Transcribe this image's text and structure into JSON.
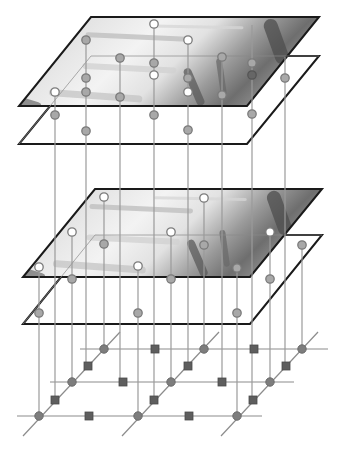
{
  "diagram": {
    "kind": "multi-layer 3D lattice with image planes",
    "colors": {
      "background": "#ffffff",
      "plane_border": "#1a1a1a",
      "vertical_line": "#9a9a9a",
      "grid_line": "#8c8c8c",
      "node_gray_fill": "#a8a8a8",
      "node_gray_stroke": "#7a7a7a",
      "node_white_fill": "#ffffff",
      "node_white_stroke": "#7a7a7a",
      "node_dark_fill": "#666666",
      "grid_circle_fill": "#7d7d7d",
      "grid_square_fill": "#5e5e5e"
    },
    "planes": [
      {
        "name": "top-image-plane",
        "image": true,
        "points": [
          [
            91,
            17
          ],
          [
            319,
            17
          ],
          [
            247,
            106
          ],
          [
            19,
            106
          ]
        ]
      },
      {
        "name": "top-blank-plane",
        "image": false,
        "points": [
          [
            91,
            56
          ],
          [
            319,
            56
          ],
          [
            247,
            144
          ],
          [
            19,
            144
          ]
        ]
      },
      {
        "name": "lower-image-plane",
        "image": true,
        "points": [
          [
            95,
            189
          ],
          [
            322,
            189
          ],
          [
            250,
            277
          ],
          [
            23,
            277
          ]
        ]
      },
      {
        "name": "lower-blank-plane",
        "image": false,
        "points": [
          [
            95,
            235
          ],
          [
            322,
            235
          ],
          [
            250,
            324
          ],
          [
            23,
            324
          ]
        ]
      }
    ],
    "verticals": [
      {
        "x": 55,
        "y1": 92,
        "y2": 400
      },
      {
        "x": 86,
        "y1": 40,
        "y2": 366
      },
      {
        "x": 120,
        "y1": 58,
        "y2": 382
      },
      {
        "x": 154,
        "y1": 24,
        "y2": 400
      },
      {
        "x": 188,
        "y1": 40,
        "y2": 366
      },
      {
        "x": 222,
        "y1": 57,
        "y2": 382
      },
      {
        "x": 252,
        "y1": 25,
        "y2": 400
      },
      {
        "x": 285,
        "y1": 57,
        "y2": 366
      },
      {
        "x": 39,
        "y1": 267,
        "y2": 416
      },
      {
        "x": 72,
        "y1": 232,
        "y2": 382
      },
      {
        "x": 104,
        "y1": 197,
        "y2": 349
      },
      {
        "x": 138,
        "y1": 266,
        "y2": 416
      },
      {
        "x": 171,
        "y1": 232,
        "y2": 382
      },
      {
        "x": 204,
        "y1": 198,
        "y2": 349
      },
      {
        "x": 237,
        "y1": 268,
        "y2": 416
      },
      {
        "x": 270,
        "y1": 232,
        "y2": 382
      },
      {
        "x": 302,
        "y1": 245,
        "y2": 349
      }
    ],
    "nodes": [
      {
        "x": 55,
        "y": 92,
        "type": "white"
      },
      {
        "x": 55,
        "y": 115,
        "type": "gray"
      },
      {
        "x": 86,
        "y": 40,
        "type": "gray"
      },
      {
        "x": 86,
        "y": 78,
        "type": "gray"
      },
      {
        "x": 86,
        "y": 92,
        "type": "gray"
      },
      {
        "x": 86,
        "y": 131,
        "type": "gray"
      },
      {
        "x": 120,
        "y": 58,
        "type": "gray"
      },
      {
        "x": 120,
        "y": 97,
        "type": "gray"
      },
      {
        "x": 154,
        "y": 24,
        "type": "white"
      },
      {
        "x": 154,
        "y": 63,
        "type": "gray"
      },
      {
        "x": 154,
        "y": 75,
        "type": "white"
      },
      {
        "x": 154,
        "y": 115,
        "type": "gray"
      },
      {
        "x": 188,
        "y": 40,
        "type": "white"
      },
      {
        "x": 188,
        "y": 78,
        "type": "gray"
      },
      {
        "x": 188,
        "y": 92,
        "type": "white"
      },
      {
        "x": 188,
        "y": 130,
        "type": "gray"
      },
      {
        "x": 222,
        "y": 57,
        "type": "gray"
      },
      {
        "x": 222,
        "y": 95,
        "type": "gray"
      },
      {
        "x": 252,
        "y": 63,
        "type": "gray"
      },
      {
        "x": 252,
        "y": 75,
        "type": "dark"
      },
      {
        "x": 252,
        "y": 114,
        "type": "gray"
      },
      {
        "x": 285,
        "y": 78,
        "type": "gray"
      },
      {
        "x": 39,
        "y": 267,
        "type": "white"
      },
      {
        "x": 39,
        "y": 313,
        "type": "gray"
      },
      {
        "x": 72,
        "y": 232,
        "type": "white"
      },
      {
        "x": 72,
        "y": 279,
        "type": "gray"
      },
      {
        "x": 104,
        "y": 197,
        "type": "white"
      },
      {
        "x": 104,
        "y": 244,
        "type": "gray"
      },
      {
        "x": 138,
        "y": 266,
        "type": "white"
      },
      {
        "x": 138,
        "y": 313,
        "type": "gray"
      },
      {
        "x": 171,
        "y": 232,
        "type": "white"
      },
      {
        "x": 171,
        "y": 279,
        "type": "gray"
      },
      {
        "x": 204,
        "y": 198,
        "type": "white"
      },
      {
        "x": 204,
        "y": 245,
        "type": "gray"
      },
      {
        "x": 237,
        "y": 268,
        "type": "gray"
      },
      {
        "x": 237,
        "y": 313,
        "type": "gray"
      },
      {
        "x": 270,
        "y": 232,
        "type": "white"
      },
      {
        "x": 270,
        "y": 279,
        "type": "gray"
      },
      {
        "x": 302,
        "y": 245,
        "type": "gray"
      }
    ],
    "grid": {
      "rows": [
        {
          "y": 416,
          "x1": 17,
          "x2": 262
        },
        {
          "y": 382,
          "x1": 50,
          "x2": 294
        },
        {
          "y": 349,
          "x1": 80,
          "x2": 328
        }
      ],
      "diagonals": [
        {
          "x1": 23,
          "y1": 436,
          "x2": 120,
          "y2": 332
        },
        {
          "x1": 122,
          "y1": 436,
          "x2": 219,
          "y2": 332
        },
        {
          "x1": 221,
          "y1": 436,
          "x2": 318,
          "y2": 332
        }
      ],
      "circles": [
        [
          39,
          416
        ],
        [
          138,
          416
        ],
        [
          237,
          416
        ],
        [
          72,
          382
        ],
        [
          171,
          382
        ],
        [
          270,
          382
        ],
        [
          104,
          349
        ],
        [
          204,
          349
        ],
        [
          302,
          349
        ]
      ],
      "squares": [
        [
          89,
          416
        ],
        [
          189,
          416
        ],
        [
          123,
          382
        ],
        [
          222,
          382
        ],
        [
          155,
          349
        ],
        [
          254,
          349
        ],
        [
          55,
          400
        ],
        [
          88,
          366
        ],
        [
          154,
          400
        ],
        [
          188,
          366
        ],
        [
          253,
          400
        ],
        [
          286,
          366
        ]
      ]
    }
  }
}
